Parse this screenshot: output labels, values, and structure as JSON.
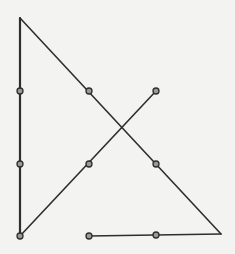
{
  "diagram": {
    "type": "nine-dot-puzzle",
    "line_color": "#2e2e2e",
    "background": "#f3f3f1",
    "dot_grid": {
      "columns_x": [
        20,
        89,
        156
      ],
      "rows_y": [
        91,
        164,
        236
      ]
    },
    "path_points": [
      {
        "x": 20,
        "y": 18
      },
      {
        "x": 20,
        "y": 236
      },
      {
        "x": 156,
        "y": 91
      },
      {
        "x": 89,
        "y": 236
      }
    ],
    "segments": [
      {
        "x1": 20,
        "y1": 18,
        "x2": 20,
        "y2": 236
      },
      {
        "x1": 20,
        "y1": 236,
        "x2": 156,
        "y2": 91
      },
      {
        "x1": 20,
        "y1": 18,
        "x2": 221,
        "y2": 234
      },
      {
        "x1": 221,
        "y1": 234,
        "x2": 89,
        "y2": 236
      }
    ],
    "dots": [
      {
        "x": 20,
        "y": 91
      },
      {
        "x": 89,
        "y": 91
      },
      {
        "x": 156,
        "y": 91
      },
      {
        "x": 20,
        "y": 164
      },
      {
        "x": 89,
        "y": 164
      },
      {
        "x": 156,
        "y": 164
      },
      {
        "x": 20,
        "y": 236
      },
      {
        "x": 89,
        "y": 236
      },
      {
        "x": 156,
        "y": 235
      }
    ]
  }
}
